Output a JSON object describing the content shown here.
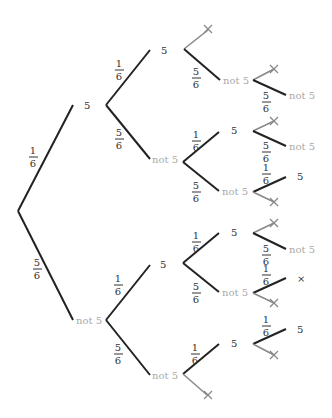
{
  "diagram": {
    "type": "probability-tree",
    "outcome_labels": {
      "five": "5",
      "not_five": "not 5"
    },
    "probabilities": {
      "five": {
        "num": "1",
        "den": "6"
      },
      "not_five": {
        "num": "5",
        "den": "6"
      }
    },
    "colors": {
      "active_branch": "#222222",
      "pruned_branch": "#888888",
      "five_label": "#333333",
      "not_five_label": "#aaaaaa",
      "cross": "#888888"
    },
    "levels": [
      {
        "level": 1,
        "nodes": [
          {
            "id": "n1",
            "label": "5",
            "prob": "1/6"
          },
          {
            "id": "n2",
            "label": "not 5",
            "prob": "5/6"
          }
        ]
      },
      {
        "level": 2,
        "nodes": [
          {
            "id": "n11",
            "parent": "n1",
            "label": "5",
            "prob": "1/6"
          },
          {
            "id": "n12",
            "parent": "n1",
            "label": "not 5",
            "prob": "5/6"
          },
          {
            "id": "n21",
            "parent": "n2",
            "label": "5",
            "prob": "1/6"
          },
          {
            "id": "n22",
            "parent": "n2",
            "label": "not 5",
            "prob": "5/6"
          }
        ]
      },
      {
        "level": 3,
        "nodes": [
          {
            "id": "n111",
            "parent": "n11",
            "label": "×",
            "pruned": true
          },
          {
            "id": "n112",
            "parent": "n11",
            "label": "not 5",
            "prob": "5/6"
          },
          {
            "id": "n121",
            "parent": "n12",
            "label": "5",
            "prob": "1/6"
          },
          {
            "id": "n122",
            "parent": "n12",
            "label": "not 5",
            "prob": "5/6"
          },
          {
            "id": "n211",
            "parent": "n21",
            "label": "5",
            "prob": "1/6"
          },
          {
            "id": "n212",
            "parent": "n21",
            "label": "not 5",
            "prob": "5/6"
          },
          {
            "id": "n221",
            "parent": "n22",
            "label": "5",
            "prob": "1/6"
          },
          {
            "id": "n222",
            "parent": "n22",
            "label": "×",
            "pruned": true
          }
        ]
      },
      {
        "level": 4,
        "nodes": [
          {
            "id": "n1121",
            "parent": "n112",
            "label": "×",
            "pruned": true
          },
          {
            "id": "n1122",
            "parent": "n112",
            "label": "not 5",
            "prob": "5/6"
          },
          {
            "id": "n1211",
            "parent": "n121",
            "label": "×",
            "pruned": true
          },
          {
            "id": "n1212",
            "parent": "n121",
            "label": "not 5",
            "prob": "5/6"
          },
          {
            "id": "n1221",
            "parent": "n122",
            "label": "5",
            "prob": "1/6"
          },
          {
            "id": "n1222",
            "parent": "n122",
            "label": "×",
            "pruned": true
          },
          {
            "id": "n2111",
            "parent": "n211",
            "label": "×",
            "pruned": true
          },
          {
            "id": "n2112",
            "parent": "n211",
            "label": "not 5",
            "prob": "5/6"
          },
          {
            "id": "n2121",
            "parent": "n212",
            "label": "5",
            "prob": "1/6"
          },
          {
            "id": "n2122",
            "parent": "n212",
            "label": "×",
            "pruned": true
          },
          {
            "id": "n2211",
            "parent": "n221",
            "label": "5",
            "prob": "1/6"
          },
          {
            "id": "n2212",
            "parent": "n221",
            "label": "×",
            "pruned": true
          }
        ]
      }
    ]
  }
}
